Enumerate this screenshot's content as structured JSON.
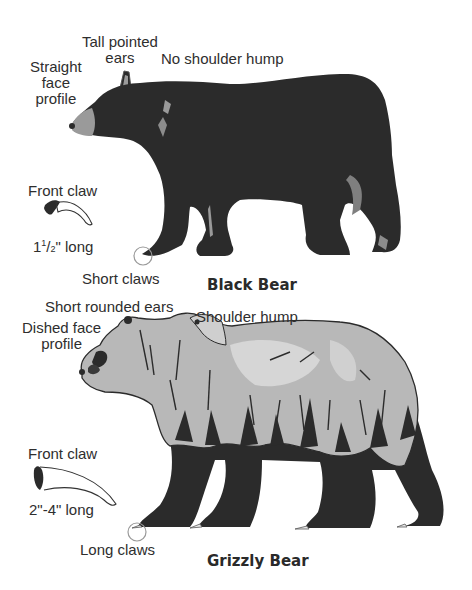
{
  "black_bear": {
    "title": "Black Bear",
    "labels": {
      "face": [
        "Straight",
        "face",
        "profile"
      ],
      "ears": [
        "Tall pointed",
        "ears"
      ],
      "hump": "No shoulder hump",
      "front_claw": "Front claw",
      "claw_length_whole": "1",
      "claw_length_num": "1",
      "claw_length_den": "2",
      "claw_length_suffix": "\" long",
      "claws": "Short claws"
    },
    "colors": {
      "body": "#2b2b2b",
      "muzzle": "#9a9a9a",
      "highlight": "#8c8c8c"
    }
  },
  "grizzly_bear": {
    "title": "Grizzly Bear",
    "labels": {
      "ears": "Short rounded ears",
      "face": [
        "Dished face",
        "profile"
      ],
      "hump": "Shoulder hump",
      "front_claw": "Front claw",
      "claw_length": "2\"-4\" long",
      "claws": "Long claws"
    },
    "colors": {
      "coat": "#b8b8b8",
      "legs": "#2b2b2b",
      "light": "#d6d6d6"
    }
  }
}
